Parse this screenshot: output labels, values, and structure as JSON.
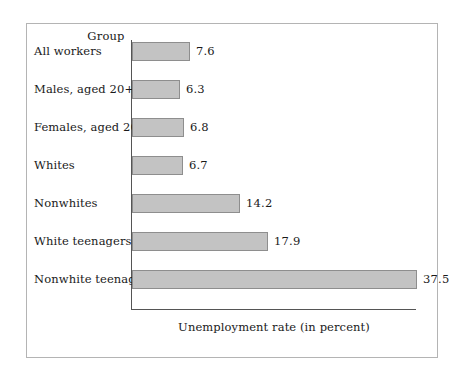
{
  "figure": {
    "group_header": "Group",
    "x_axis_title": "Unemployment rate (in percent)"
  },
  "chart_data": {
    "type": "bar",
    "orientation": "horizontal",
    "title": "",
    "subtitle": "",
    "xlabel": "Unemployment rate (in percent)",
    "ylabel": "Group",
    "categories": [
      "All workers",
      "Males, aged 20+",
      "Females, aged 20+",
      "Whites",
      "Nonwhites",
      "White teenagers",
      "Nonwhite teenagers"
    ],
    "values": [
      7.6,
      6.3,
      6.8,
      6.7,
      14.2,
      17.9,
      37.5
    ],
    "value_labels": [
      "7.6",
      "6.3",
      "6.8",
      "6.7",
      "14.2",
      "17.9",
      "37.5"
    ],
    "xlim": [
      0,
      37.5
    ],
    "grid": false,
    "legend": null,
    "bar_color": "#c3c3c3",
    "bar_edge_color": "#8e8e8e",
    "axis_color": "#555555",
    "frame_color": "#b4b4b4"
  }
}
